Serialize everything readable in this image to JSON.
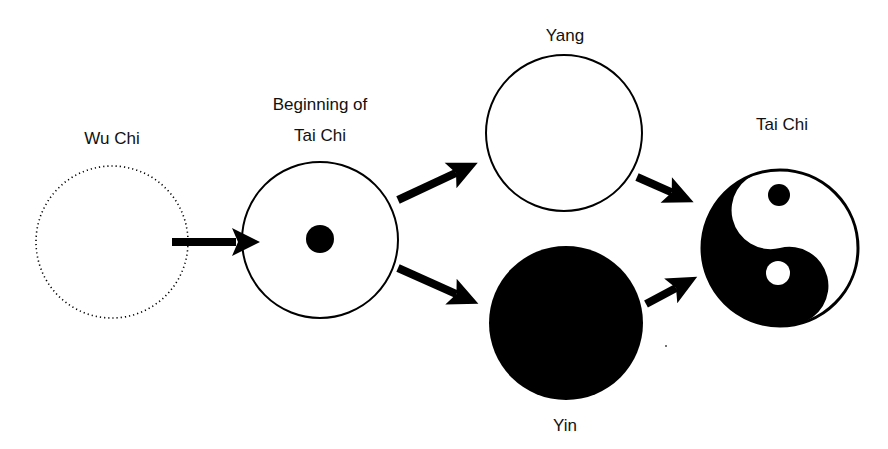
{
  "diagram": {
    "colors": {
      "ink": "#000000",
      "paper": "#ffffff",
      "text": "#111111"
    },
    "nodes": {
      "wu_chi": {
        "label": "Wu Chi",
        "style": "dotted-empty-circle"
      },
      "beginning": {
        "label_line1": "Beginning of",
        "label_line2": "Tai Chi",
        "style": "circle-with-center-dot"
      },
      "yang": {
        "label": "Yang",
        "style": "empty-circle"
      },
      "yin": {
        "label": "Yin",
        "style": "filled-circle"
      },
      "tai_chi": {
        "label": "Tai Chi",
        "style": "yin-yang-symbol"
      }
    },
    "edges": [
      {
        "from": "wu_chi",
        "to": "beginning"
      },
      {
        "from": "beginning",
        "to": "yang"
      },
      {
        "from": "beginning",
        "to": "yin"
      },
      {
        "from": "yang",
        "to": "tai_chi"
      },
      {
        "from": "yin",
        "to": "tai_chi"
      }
    ]
  }
}
